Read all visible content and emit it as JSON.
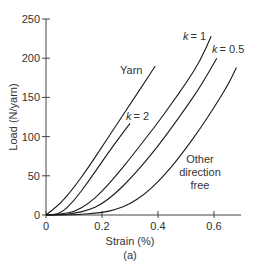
{
  "chart_data": {
    "type": "line",
    "title": "",
    "caption": "(a)",
    "xlabel": "Strain (%)",
    "ylabel": "Load (N/yarn)",
    "xlim": [
      0,
      0.7
    ],
    "ylim": [
      0,
      250
    ],
    "xticks": [
      0,
      0.2,
      0.4,
      0.6
    ],
    "xtick_labels": [
      "0",
      "0.2",
      "0.4",
      "0.6"
    ],
    "yticks": [
      0,
      50,
      100,
      150,
      200,
      250
    ],
    "ytick_labels": [
      "0",
      "50",
      "100",
      "150",
      "200",
      "250"
    ],
    "grid": false,
    "legend": "inline labels",
    "series": [
      {
        "name": "Yarn",
        "label": "Yarn",
        "x": [
          0,
          0.05,
          0.1,
          0.15,
          0.2,
          0.25,
          0.3,
          0.35,
          0.39
        ],
        "y": [
          0,
          14,
          35,
          60,
          87,
          114,
          141,
          168,
          190
        ]
      },
      {
        "name": "k = 2",
        "label": "k = 2",
        "x": [
          0,
          0.05,
          0.1,
          0.15,
          0.2,
          0.25,
          0.3
        ],
        "y": [
          0,
          1,
          18,
          42,
          68,
          93,
          117
        ]
      },
      {
        "name": "k = 1",
        "label": "k = 1",
        "x": [
          0,
          0.05,
          0.1,
          0.15,
          0.2,
          0.25,
          0.3,
          0.35,
          0.4,
          0.45,
          0.5,
          0.55,
          0.59
        ],
        "y": [
          0,
          1,
          4,
          14,
          30,
          50,
          72,
          95,
          118,
          143,
          168,
          196,
          228
        ]
      },
      {
        "name": "k = 0.5",
        "label": "k = 0.5",
        "x": [
          0,
          0.05,
          0.1,
          0.15,
          0.2,
          0.25,
          0.3,
          0.35,
          0.4,
          0.45,
          0.5,
          0.55,
          0.61
        ],
        "y": [
          0,
          0,
          2,
          6,
          14,
          28,
          46,
          66,
          88,
          112,
          137,
          163,
          200
        ]
      },
      {
        "name": "Other direction free",
        "label": "Other direction free",
        "x": [
          0,
          0.1,
          0.2,
          0.25,
          0.3,
          0.35,
          0.4,
          0.45,
          0.5,
          0.55,
          0.6,
          0.65,
          0.68
        ],
        "y": [
          0,
          0,
          3,
          7,
          14,
          26,
          42,
          62,
          85,
          110,
          137,
          166,
          188
        ]
      }
    ]
  },
  "labels": {
    "yarn": "Yarn",
    "k2": "= 2",
    "k1": "= 1",
    "k05": "= 0.5",
    "k": "k",
    "other_line1": "Other",
    "other_line2": "direction",
    "other_line3": "free",
    "xlabel": "Strain (%)",
    "ylabel": "Load (N/yarn)",
    "caption": "(a)"
  }
}
